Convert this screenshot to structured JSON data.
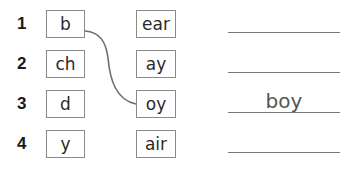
{
  "rows": [
    {
      "number": "1",
      "left": "b",
      "right": "ear",
      "answer": ""
    },
    {
      "number": "2",
      "left": "ch",
      "right": "ay",
      "answer": ""
    },
    {
      "number": "3",
      "left": "d",
      "right": "oy",
      "answer": "boy"
    },
    {
      "number": "4",
      "left": "y",
      "right": "air",
      "answer": ""
    }
  ],
  "connections": [
    {
      "from": "b",
      "to": "oy"
    }
  ],
  "colors": {
    "line": "#6e6e6e",
    "box_border": "#8a8a8a"
  }
}
